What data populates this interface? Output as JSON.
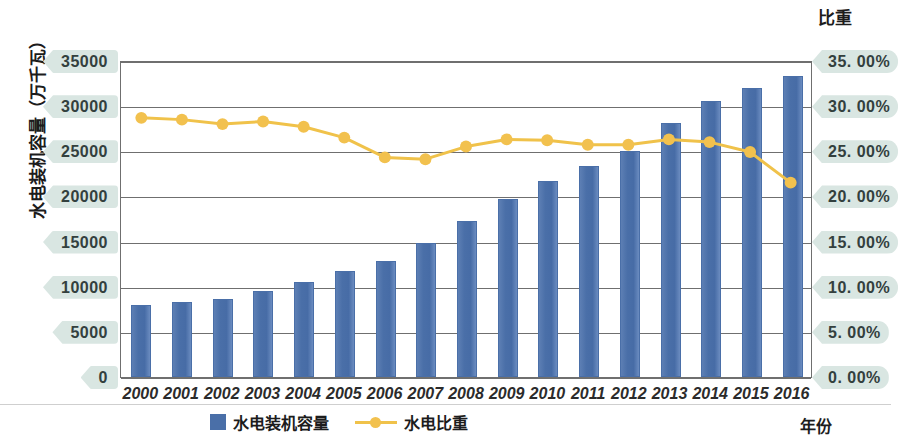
{
  "left_axis": {
    "title": "水电装机容量（万千瓦）",
    "ticks": [
      "35000",
      "30000",
      "25000",
      "20000",
      "15000",
      "10000",
      "5000",
      "0"
    ],
    "min": 0,
    "max": 35000,
    "step": 5000
  },
  "right_axis": {
    "title": "比重",
    "ticks": [
      "35. 00%",
      "30. 00%",
      "25. 00%",
      "20. 00%",
      "15. 00%",
      "10. 00%",
      "5. 00%",
      "0. 00%"
    ],
    "min": 0,
    "max": 35,
    "step": 5
  },
  "x_axis": {
    "title": "年份"
  },
  "legend": {
    "bar_label": "水电装机容量",
    "line_label": "水电比重"
  },
  "colors": {
    "bar": "#4a6fa8",
    "line": "#f0c24a",
    "marker": "#f2c14e",
    "pill": "#d9e6e2",
    "grid": "#6f6f6f"
  },
  "chart_data": {
    "type": "bar",
    "title": "",
    "xlabel": "年份",
    "ylabel": "水电装机容量（万千瓦）",
    "y2label": "比重",
    "ylim": [
      0,
      35000
    ],
    "y2lim": [
      0,
      35
    ],
    "grid": true,
    "legend_position": "bottom",
    "categories": [
      "2000",
      "2001",
      "2002",
      "2003",
      "2004",
      "2005",
      "2006",
      "2007",
      "2008",
      "2009",
      "2010",
      "2011",
      "2012",
      "2013",
      "2014",
      "2015",
      "2016"
    ],
    "series": [
      {
        "name": "水电装机容量",
        "type": "bar",
        "axis": "left",
        "unit": "万千瓦",
        "values": [
          7935,
          8301,
          8607,
          9490,
          10524,
          11739,
          12857,
          14823,
          17260,
          19679,
          21606,
          23298,
          24947,
          28044,
          30486,
          31954,
          33211
        ]
      },
      {
        "name": "水电比重",
        "type": "line",
        "axis": "right",
        "unit": "%",
        "values": [
          28.8,
          28.6,
          28.1,
          28.4,
          27.8,
          26.6,
          24.4,
          24.2,
          25.6,
          26.4,
          26.3,
          25.8,
          25.8,
          26.4,
          26.1,
          25.0,
          21.6
        ]
      }
    ]
  }
}
